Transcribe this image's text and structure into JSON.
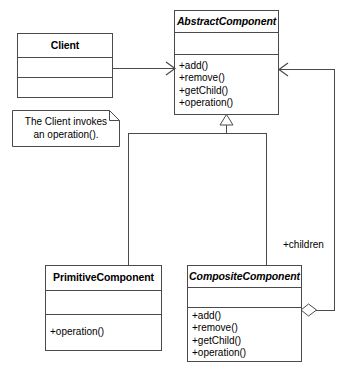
{
  "diagram": {
    "type": "uml-class-diagram",
    "background_color": "#ffffff",
    "line_color": "#4a4a4a",
    "text_color": "#000000"
  },
  "classes": {
    "client": {
      "name": "Client",
      "abstract": false,
      "attributes": [],
      "operations": []
    },
    "abstract_component": {
      "name": "AbstractComponent",
      "abstract": true,
      "attributes": [],
      "operations": [
        "+add()",
        "+remove()",
        "+getChild()",
        "+operation()"
      ]
    },
    "primitive_component": {
      "name": "PrimitiveComponent",
      "abstract": false,
      "attributes": [],
      "operations": [
        "+operation()"
      ]
    },
    "composite_component": {
      "name": "CompositeComponent",
      "abstract": true,
      "attributes": [],
      "operations": [
        "+add()",
        "+remove()",
        "+getChild()",
        "+operation()"
      ]
    }
  },
  "note": {
    "line1": "The Client invokes",
    "line2": "an operation()."
  },
  "relationships": {
    "client_association": {
      "kind": "association",
      "from": "Client",
      "to": "AbstractComponent",
      "label": ""
    },
    "primitive_inheritance": {
      "kind": "generalization",
      "from": "PrimitiveComponent",
      "to": "AbstractComponent",
      "label": ""
    },
    "composite_inheritance": {
      "kind": "generalization",
      "from": "CompositeComponent",
      "to": "AbstractComponent",
      "label": ""
    },
    "children_aggregation": {
      "kind": "aggregation",
      "from": "CompositeComponent",
      "to": "AbstractComponent",
      "label": "+children"
    }
  }
}
